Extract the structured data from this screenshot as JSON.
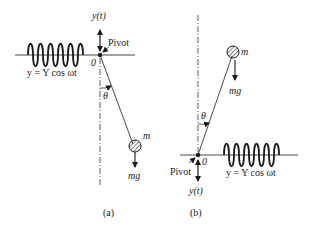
{
  "figure_a": {
    "caption": "(a)",
    "displacement_label": "y(t)",
    "pivot_label": "Pivot",
    "origin_label": "0",
    "angle_label": "θ",
    "mass_label": "m",
    "weight_label": "mg",
    "excitation_label": "y = Y cos ωt"
  },
  "figure_b": {
    "caption": "(b)",
    "displacement_label": "y(t)",
    "pivot_label": "Pivot",
    "origin_label": "0",
    "angle_label": "θ",
    "mass_label": "m",
    "weight_label": "mg",
    "excitation_label": "y = Y cos ωt"
  },
  "colors": {
    "ink": "#1a1a1a",
    "background": "#ffffff"
  }
}
